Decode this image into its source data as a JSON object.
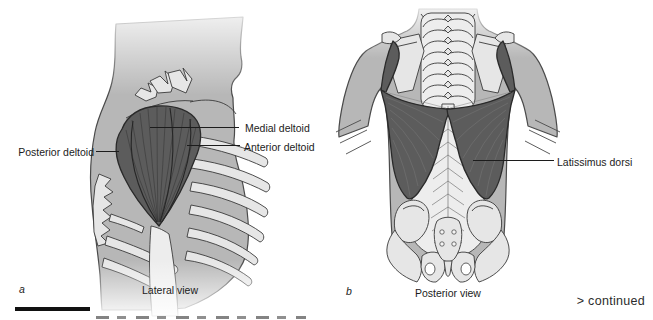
{
  "colors": {
    "muscle": "#5c5c5c",
    "body": "#b7b7b7",
    "bone": "#e6e6e6",
    "bonestroke": "#3a3a3a",
    "outline": "#4a4a4a",
    "text": "#1c1c1c",
    "bar": "#111111"
  },
  "panel_a": {
    "letter": "a",
    "caption": "Lateral view",
    "labels": {
      "posterior": "Posterior deltoid",
      "medial": "Medial deltoid",
      "anterior": "Anterior deltoid"
    }
  },
  "panel_b": {
    "letter": "b",
    "caption": "Posterior view",
    "labels": {
      "latissimus": "Latissimus dorsi"
    }
  },
  "footer": {
    "continued": "> continued",
    "clipped_caption": "FIGURE"
  }
}
